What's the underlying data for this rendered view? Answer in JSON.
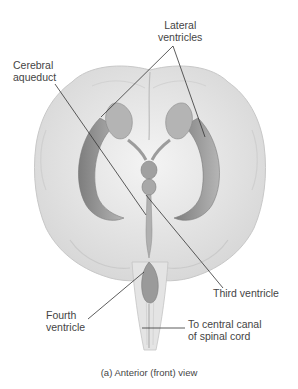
{
  "figure": {
    "caption": "(a) Anterior (front) view"
  },
  "labels": {
    "lateral_ventricles": [
      "Lateral",
      "ventricles"
    ],
    "cerebral_aqueduct": [
      "Cerebral",
      "aqueduct"
    ],
    "third_ventricle": [
      "Third ventricle"
    ],
    "fourth_ventricle": [
      "Fourth",
      "ventricle"
    ],
    "central_canal": [
      "To central canal",
      "of spinal cord"
    ]
  },
  "colors": {
    "background": "#ffffff",
    "brain_fill": "#ececec",
    "brain_shadow": "#cfcfcf",
    "ventricle_fill": "#9a9a9a",
    "leader_line": "#333333",
    "text": "#444444"
  }
}
